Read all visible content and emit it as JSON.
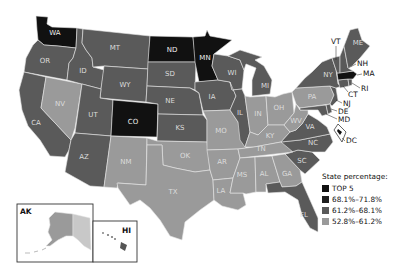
{
  "legend": {
    "title": "State percentage:",
    "items": [
      {
        "label": "TOP 5",
        "color": "#111111"
      },
      {
        "label": "68.1%–71.8%",
        "color": "#1e1e1e"
      },
      {
        "label": "61.2%–68.1%",
        "color": "#5a5a5a"
      },
      {
        "label": "52.8%–61.2%",
        "color": "#9a9a9a"
      }
    ]
  },
  "colors": {
    "top5": "#111111",
    "high": "#1e1e1e",
    "mid": "#5a5a5a",
    "low": "#9a9a9a",
    "border": "#e6e6e6"
  },
  "states": {
    "top5": [
      "WA",
      "ND",
      "MN",
      "CO",
      "MA"
    ],
    "mid": [
      "OR",
      "CA",
      "ID",
      "MT",
      "WY",
      "UT",
      "AZ",
      "SD",
      "NE",
      "KS",
      "IA",
      "WI",
      "IL",
      "MI",
      "NY",
      "VT",
      "NH",
      "ME",
      "CT",
      "RI",
      "NJ",
      "DE",
      "MD",
      "VA",
      "NC",
      "SC",
      "FL",
      "DC"
    ],
    "low": [
      "NV",
      "NM",
      "TX",
      "OK",
      "MO",
      "AR",
      "LA",
      "MS",
      "AL",
      "GA",
      "TN",
      "KY",
      "IN",
      "OH",
      "PA",
      "WV",
      "AK",
      "HI"
    ]
  },
  "labels": {
    "WA": "WA",
    "OR": "OR",
    "CA": "CA",
    "ID": "ID",
    "NV": "NV",
    "MT": "MT",
    "WY": "WY",
    "UT": "UT",
    "AZ": "AZ",
    "CO": "CO",
    "NM": "NM",
    "ND": "ND",
    "SD": "SD",
    "NE": "NE",
    "KS": "KS",
    "OK": "OK",
    "TX": "TX",
    "MN": "MN",
    "IA": "IA",
    "MO": "MO",
    "AR": "AR",
    "LA": "LA",
    "WI": "WI",
    "IL": "IL",
    "MI": "MI",
    "IN": "IN",
    "OH": "OH",
    "KY": "KY",
    "TN": "TN",
    "MS": "MS",
    "AL": "AL",
    "GA": "GA",
    "FL": "FL",
    "SC": "SC",
    "NC": "NC",
    "VA": "VA",
    "WV": "WV",
    "PA": "PA",
    "NY": "NY",
    "VT": "VT",
    "NH": "NH",
    "ME": "ME",
    "MA": "MA",
    "RI": "RI",
    "CT": "CT",
    "NJ": "NJ",
    "DE": "DE",
    "MD": "MD",
    "DC": "DC",
    "AK": "AK",
    "HI": "HI"
  }
}
